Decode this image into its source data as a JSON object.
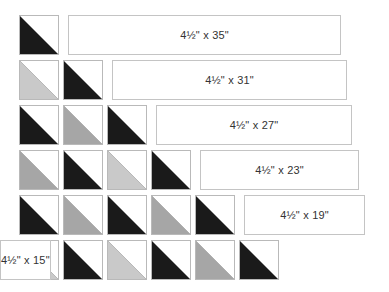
{
  "colors": {
    "black": "#1a1a1a",
    "medium": "#a6a6a6",
    "light": "#c9c9c9",
    "border": "#b9b9b9"
  },
  "rows": [
    {
      "label": "4½\" x 35\"",
      "squares": [
        "black"
      ]
    },
    {
      "label": "4½\" x 31\"",
      "squares": [
        "light",
        "black"
      ]
    },
    {
      "label": "4½\" x 27\"",
      "squares": [
        "black",
        "medium",
        "black"
      ]
    },
    {
      "label": "4½\" x 23\"",
      "squares": [
        "medium",
        "black",
        "light",
        "black"
      ]
    },
    {
      "label": "4½\" x 19\"",
      "squares": [
        "black",
        "medium",
        "black",
        "medium",
        "black"
      ]
    },
    {
      "label": "4½\" x 15\"",
      "squares": [
        "light",
        "black",
        "light",
        "black",
        "medium",
        "black"
      ]
    }
  ]
}
